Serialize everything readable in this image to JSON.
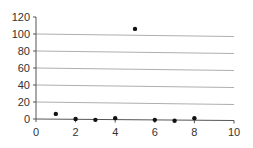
{
  "chart_data": {
    "type": "scatter",
    "title": "",
    "xlabel": "",
    "ylabel": "",
    "xlim": [
      0,
      10
    ],
    "ylim": [
      0,
      120
    ],
    "x_ticks": [
      0,
      2,
      4,
      6,
      8,
      10
    ],
    "y_ticks": [
      0,
      20,
      40,
      60,
      80,
      100,
      120
    ],
    "grid": {
      "horizontal": true,
      "vertical": false
    },
    "legend": null,
    "series": [
      {
        "name": "",
        "points": [
          {
            "x": 1,
            "y": 6
          },
          {
            "x": 2,
            "y": 0
          },
          {
            "x": 3,
            "y": -1
          },
          {
            "x": 4,
            "y": 1
          },
          {
            "x": 5,
            "y": 106
          },
          {
            "x": 6,
            "y": -1
          },
          {
            "x": 7,
            "y": -2
          },
          {
            "x": 8,
            "y": 1
          }
        ]
      }
    ]
  },
  "colors": {
    "marker": "#111111",
    "axis": "#555555",
    "grid": "#999999",
    "text": "#333333"
  }
}
